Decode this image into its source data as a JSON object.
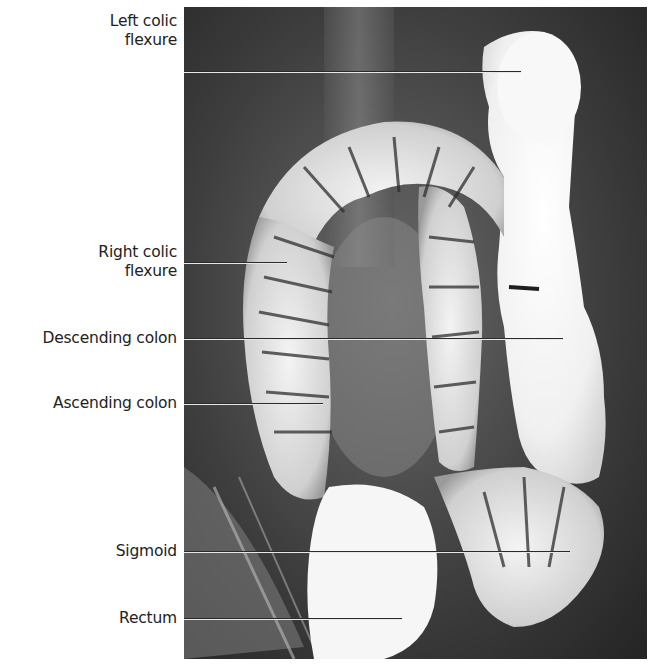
{
  "figure": {
    "type": "radiograph"
  },
  "labels": [
    {
      "id": "left-colic-flexure",
      "lines": [
        "Left colic",
        "flexure"
      ],
      "text_top": 12,
      "line_y": 72,
      "line_end_x": 521
    },
    {
      "id": "right-colic-flexure",
      "lines": [
        "Right colic",
        "flexure"
      ],
      "text_top": 243,
      "line_y": 263,
      "line_end_x": 287
    },
    {
      "id": "descending-colon",
      "lines": [
        "Descending colon"
      ],
      "text_top": 329,
      "line_y": 339,
      "line_end_x": 563
    },
    {
      "id": "ascending-colon",
      "lines": [
        "Ascending colon"
      ],
      "text_top": 394,
      "line_y": 404,
      "line_end_x": 323
    },
    {
      "id": "sigmoid",
      "lines": [
        "Sigmoid"
      ],
      "text_top": 542,
      "line_y": 552,
      "line_end_x": 570
    },
    {
      "id": "rectum",
      "lines": [
        "Rectum"
      ],
      "text_top": 609,
      "line_y": 619,
      "line_end_x": 402
    }
  ],
  "colors": {
    "background": "#ffffff",
    "label_text": "#222222",
    "leader_line": "#2a2a2a",
    "leader_line_highlight": "#e8e8e8",
    "film_dark": "#333333",
    "barium_white": "#f4f4f4"
  }
}
